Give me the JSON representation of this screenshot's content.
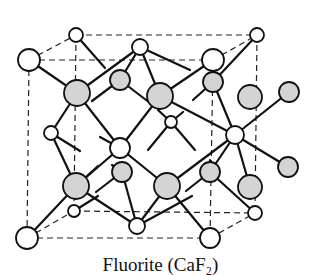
{
  "figure": {
    "caption": "Fluorite (CaF₂)",
    "structure": "fluorite unit cell",
    "legend": {
      "white_atoms": "cation",
      "gray_atoms": "anion"
    },
    "colors": {
      "cation_fill": "#ffffff",
      "anion_fill": "#d4d4d4",
      "outline": "#111111"
    }
  }
}
